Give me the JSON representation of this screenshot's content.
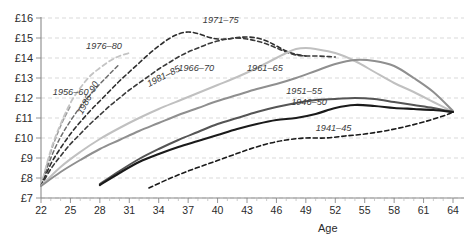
{
  "chart_data": {
    "type": "line",
    "title": "",
    "xlabel": "Age",
    "ylabel": "",
    "xlim": [
      22,
      64
    ],
    "ylim": [
      7,
      16
    ],
    "grid": true,
    "legend_position": "inline-labels",
    "x_ticks": [
      22,
      25,
      28,
      31,
      34,
      37,
      40,
      43,
      46,
      49,
      52,
      55,
      58,
      61,
      64
    ],
    "x_tick_labels": [
      "22",
      "25",
      "28",
      "31",
      "34",
      "37",
      "40",
      "43",
      "46",
      "49",
      "52",
      "55",
      "58",
      "61",
      "64"
    ],
    "y_ticks": [
      7,
      8,
      9,
      10,
      11,
      12,
      13,
      14,
      15,
      16
    ],
    "y_tick_labels": [
      "£7",
      "£8",
      "£9",
      "£10",
      "£11",
      "£12",
      "£13",
      "£14",
      "£15",
      "£16"
    ],
    "series": [
      {
        "name": "1986–90",
        "label": "1986–90",
        "color": "#9a9a9a",
        "style": "dashed",
        "width": 1.5,
        "label_x": 26.2,
        "label_y": 11.15,
        "label_rotate": -62,
        "x": [
          22,
          23,
          24,
          25
        ],
        "y": [
          7.6,
          9.3,
          10.6,
          11.6
        ]
      },
      {
        "name": "1981–85",
        "label": "1981–85",
        "color": "#6d6d6d",
        "style": "dashed",
        "width": 1.5,
        "label_x": 33.0,
        "label_y": 12.55,
        "label_rotate": -27,
        "x": [
          22,
          23,
          24,
          25,
          26,
          27,
          28,
          29,
          30
        ],
        "y": [
          7.6,
          9.0,
          10.05,
          10.85,
          11.55,
          12.15,
          12.7,
          13.2,
          13.7
        ]
      },
      {
        "name": "1976–80",
        "label": "1976–80",
        "color": "#c4c4c4",
        "style": "dashed",
        "width": 1.8,
        "label_x": 26.6,
        "label_y": 14.45,
        "label_rotate": 0,
        "x": [
          22,
          23,
          24,
          25,
          26,
          27,
          28,
          29,
          30,
          31
        ],
        "y": [
          7.6,
          9.4,
          10.7,
          11.75,
          12.5,
          13.1,
          13.5,
          13.85,
          14.1,
          14.25
        ]
      },
      {
        "name": "1971–75",
        "label": "1971–75",
        "color": "#2e2e2e",
        "style": "dashed",
        "width": 1.6,
        "label_x": 38.5,
        "label_y": 15.75,
        "label_rotate": 0,
        "x": [
          22,
          23,
          24,
          25,
          26,
          27,
          28,
          29,
          30,
          31,
          32,
          33,
          34,
          35,
          36,
          37,
          38,
          39,
          40,
          41,
          42,
          43,
          44,
          45,
          46,
          47,
          48,
          49
        ],
        "y": [
          7.6,
          8.7,
          9.5,
          10.2,
          10.8,
          11.35,
          11.85,
          12.35,
          12.85,
          13.3,
          13.75,
          14.2,
          14.6,
          14.95,
          15.2,
          15.3,
          15.22,
          15.05,
          14.95,
          14.95,
          15.02,
          15.05,
          15.0,
          14.85,
          14.6,
          14.35,
          14.18,
          14.1
        ]
      },
      {
        "name": "1966–70",
        "label": "1966–70",
        "color": "#3a3a3a",
        "style": "dashed",
        "width": 1.6,
        "label_x": 36.0,
        "label_y": 13.35,
        "label_rotate": 0,
        "x": [
          22,
          23,
          24,
          25,
          26,
          27,
          28,
          29,
          30,
          31,
          32,
          33,
          34,
          35,
          36,
          37,
          38,
          39,
          40,
          41,
          42,
          43,
          44,
          45,
          46,
          47,
          48,
          49,
          50,
          51,
          52
        ],
        "y": [
          7.6,
          8.45,
          9.1,
          9.7,
          10.2,
          10.7,
          11.15,
          11.6,
          12.0,
          12.4,
          12.75,
          13.1,
          13.45,
          13.75,
          14.05,
          14.3,
          14.5,
          14.7,
          14.85,
          14.95,
          15.0,
          14.95,
          14.85,
          14.7,
          14.5,
          14.3,
          14.15,
          14.1,
          14.1,
          14.08,
          14.05
        ]
      },
      {
        "name": "1961–65",
        "label": "1961–65",
        "color": "#c0c0c0",
        "style": "solid",
        "width": 2.0,
        "label_x": 43.0,
        "label_y": 13.35,
        "label_rotate": 0,
        "x": [
          22,
          24,
          26,
          28,
          30,
          32,
          34,
          36,
          38,
          40,
          42,
          44,
          46,
          47,
          48,
          49,
          50,
          52,
          54,
          56,
          58,
          60,
          62,
          64
        ],
        "y": [
          7.6,
          8.55,
          9.3,
          9.95,
          10.5,
          11.0,
          11.45,
          11.85,
          12.25,
          12.65,
          13.05,
          13.5,
          14.0,
          14.25,
          14.45,
          14.5,
          14.45,
          14.25,
          13.85,
          13.3,
          12.75,
          12.3,
          11.8,
          11.3
        ]
      },
      {
        "name": "1956–60",
        "label": "1956–60",
        "color": "#8f8f8f",
        "style": "solid",
        "width": 2.0,
        "label_x": 23.2,
        "label_y": 12.15,
        "label_rotate": 0,
        "x": [
          22,
          24,
          26,
          28,
          30,
          32,
          34,
          36,
          38,
          40,
          42,
          44,
          46,
          48,
          50,
          52,
          54,
          56,
          58,
          60,
          62,
          64
        ],
        "y": [
          7.6,
          8.3,
          8.9,
          9.45,
          9.9,
          10.35,
          10.75,
          11.15,
          11.5,
          11.85,
          12.15,
          12.45,
          12.7,
          13.0,
          13.35,
          13.7,
          13.9,
          13.85,
          13.6,
          13.0,
          12.3,
          11.35
        ]
      },
      {
        "name": "1951–55",
        "label": "1951–55",
        "color": "#555555",
        "style": "solid",
        "width": 2.0,
        "label_x": 47.0,
        "label_y": 12.2,
        "label_rotate": 0,
        "x": [
          28,
          30,
          32,
          34,
          36,
          38,
          40,
          42,
          44,
          46,
          48,
          50,
          52,
          54,
          56,
          58,
          60,
          62,
          64
        ],
        "y": [
          7.7,
          8.35,
          8.95,
          9.45,
          9.9,
          10.3,
          10.7,
          11.0,
          11.3,
          11.55,
          11.75,
          11.9,
          11.95,
          12.0,
          11.95,
          11.8,
          11.65,
          11.5,
          11.3
        ]
      },
      {
        "name": "1946–50",
        "label": "1946–50",
        "color": "#1a1a1a",
        "style": "solid",
        "width": 2.2,
        "label_x": 47.5,
        "label_y": 11.65,
        "label_rotate": 0,
        "x": [
          28,
          30,
          32,
          34,
          36,
          38,
          40,
          42,
          44,
          46,
          48,
          50,
          52,
          54,
          56,
          58,
          60,
          62,
          64
        ],
        "y": [
          7.65,
          8.25,
          8.8,
          9.2,
          9.55,
          9.85,
          10.15,
          10.45,
          10.7,
          10.9,
          11.0,
          11.2,
          11.5,
          11.65,
          11.6,
          11.5,
          11.45,
          11.4,
          11.3
        ]
      },
      {
        "name": "1941–45",
        "label": "1941–45",
        "color": "#1a1a1a",
        "style": "dashed",
        "width": 1.6,
        "label_x": 50.0,
        "label_y": 10.35,
        "label_rotate": 0,
        "x": [
          33,
          35,
          37,
          39,
          41,
          43,
          45,
          47,
          49,
          51,
          53,
          55,
          57,
          59,
          61,
          63,
          64
        ],
        "y": [
          7.5,
          7.95,
          8.35,
          8.7,
          9.05,
          9.4,
          9.7,
          9.9,
          10.0,
          10.0,
          10.1,
          10.2,
          10.35,
          10.55,
          10.8,
          11.1,
          11.3
        ]
      }
    ]
  },
  "axis": {
    "x_title": "Age"
  }
}
